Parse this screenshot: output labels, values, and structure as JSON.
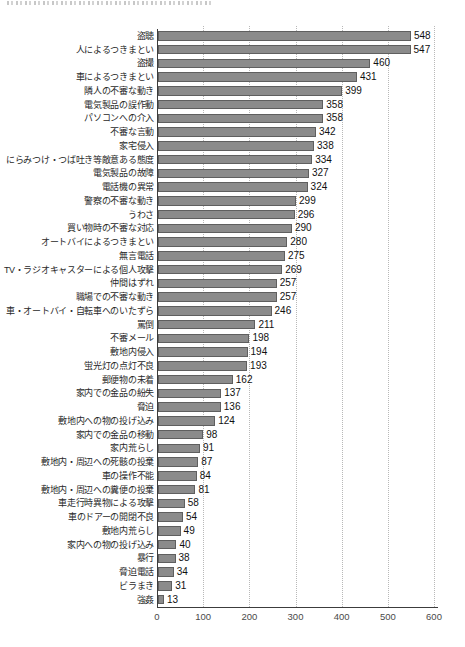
{
  "page": {
    "background": "#ffffff",
    "note_colors": {
      "bar_fill": "#8b8b8b",
      "bar_border": "#5f5f5f",
      "gridline": "#b8b8b8",
      "axis": "#3c3c3c"
    }
  },
  "chart_data": {
    "type": "bar",
    "orientation": "horizontal",
    "title": "",
    "xlabel": "",
    "ylabel": "",
    "xlim": [
      0,
      600
    ],
    "x_ticks": [
      0,
      100,
      200,
      300,
      400,
      500,
      600
    ],
    "grid": "vertical-dotted",
    "legend": "none",
    "value_labels": "end-of-bar",
    "categories": [
      "盗聴",
      "人によるつきまとい",
      "盗撮",
      "車によるつきまとい",
      "隣人の不審な動き",
      "電気製品の誤作動",
      "パソコンへの介入",
      "不審な言動",
      "家宅侵入",
      "にらみつけ・つば吐き等敵意ある態度",
      "電気製品の故障",
      "電話機の異常",
      "警察の不審な動き",
      "うわさ",
      "買い物時の不審な対応",
      "オートバイによるつきまとい",
      "無言電話",
      "TV・ラジオキャスターによる個人攻撃",
      "仲間はずれ",
      "職場での不審な動き",
      "車・オートバイ・自転車へのいたずら",
      "罵倒",
      "不審メール",
      "敷地内侵入",
      "蛍光灯の点灯不良",
      "郵便物の未着",
      "家内での金品の紛失",
      "脅迫",
      "敷地内への物の投げ込み",
      "家内での金品の移動",
      "家内荒らし",
      "敷地内・周辺への死骸の投棄",
      "車の操作不能",
      "敷地内・周辺への糞便の投棄",
      "車走行時異物による攻撃",
      "車のドアーの開閉不良",
      "敷地内荒らし",
      "家内への物の投げ込み",
      "暴行",
      "脅迫電話",
      "ビラまき",
      "強姦"
    ],
    "values": [
      548,
      547,
      460,
      431,
      399,
      358,
      358,
      342,
      338,
      334,
      327,
      324,
      299,
      296,
      290,
      280,
      275,
      269,
      257,
      257,
      246,
      211,
      198,
      194,
      193,
      162,
      137,
      136,
      124,
      98,
      91,
      87,
      84,
      81,
      58,
      54,
      49,
      40,
      38,
      34,
      31,
      13
    ]
  }
}
